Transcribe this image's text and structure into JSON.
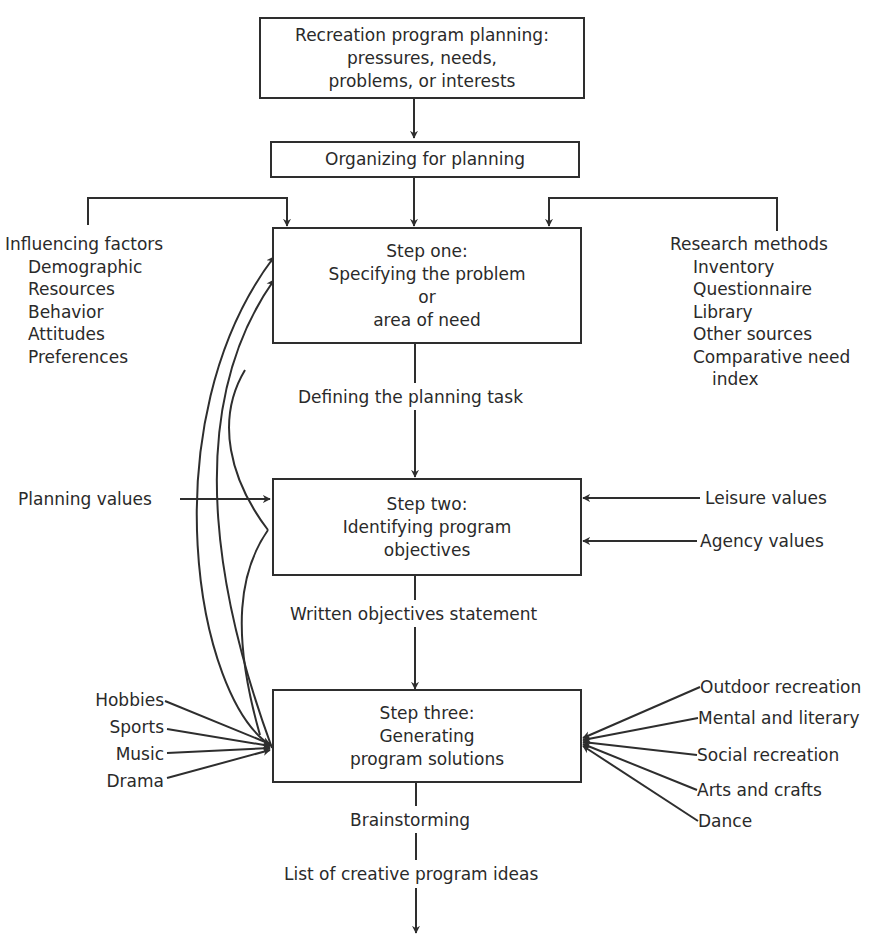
{
  "diagram": {
    "top_box": {
      "lines": [
        "Recreation program planning:",
        "pressures, needs,",
        "problems, or interests"
      ]
    },
    "organizing_box": {
      "label": "Organizing for planning"
    },
    "step_one": {
      "lines": [
        "Step one:",
        "Specifying the problem",
        "or",
        "area of need"
      ],
      "output_label": "Defining the planning task"
    },
    "step_two": {
      "lines": [
        "Step two:",
        "Identifying program",
        "objectives"
      ],
      "output_label": "Written objectives statement"
    },
    "step_three": {
      "lines": [
        "Step three:",
        "Generating",
        "program solutions"
      ],
      "output_label_1": "Brainstorming",
      "output_label_2": "List of creative program ideas"
    },
    "influencing_factors": {
      "title": "Influencing factors",
      "items": [
        "Demographic",
        "Resources",
        "Behavior",
        "Attitudes",
        "Preferences"
      ]
    },
    "research_methods": {
      "title": "Research methods",
      "items": [
        "Inventory",
        "Questionnaire",
        "Library",
        "Other sources",
        "Comparative need"
      ],
      "continuation": "index"
    },
    "planning_values": {
      "label": "Planning values"
    },
    "leisure_values": {
      "label": "Leisure values"
    },
    "agency_values": {
      "label": "Agency values"
    },
    "left_program_areas": [
      "Hobbies",
      "Sports",
      "Music",
      "Drama"
    ],
    "right_program_areas": [
      "Outdoor recreation",
      "Mental and literary",
      "Social recreation",
      "Arts and crafts",
      "Dance"
    ],
    "colors": {
      "line": "#2e2e2e",
      "text": "#2a2a2a",
      "background": "#ffffff"
    }
  }
}
